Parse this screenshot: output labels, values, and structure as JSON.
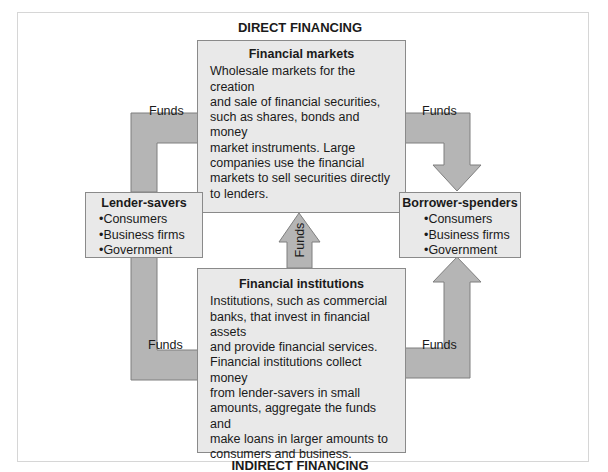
{
  "diagram": {
    "top_heading": "DIRECT FINANCING",
    "bottom_heading": "INDIRECT FINANCING",
    "financial_markets": {
      "title": "Financial markets",
      "lines": [
        "Wholesale markets for the creation",
        "and sale of financial securities,",
        "such as shares, bonds and money",
        "market instruments. Large",
        "companies use the financial",
        "markets to sell securities directly",
        "to lenders."
      ]
    },
    "financial_institutions": {
      "title": "Financial institutions",
      "lines": [
        "Institutions, such as commercial",
        "banks, that invest in financial assets",
        "and provide financial services.",
        "Financial institutions collect money",
        "from lender-savers in small",
        "amounts, aggregate the funds and",
        "make loans in larger amounts to",
        "consumers and business."
      ]
    },
    "lender_savers": {
      "title": "Lender-savers",
      "items": [
        "Consumers",
        "Business firms",
        "Government"
      ]
    },
    "borrower_spenders": {
      "title": "Borrower-spenders",
      "items": [
        "Consumers",
        "Business firms",
        "Government"
      ]
    },
    "arrows": {
      "top_left": "Funds",
      "top_right": "Funds",
      "middle": "Funds",
      "bottom_left": "Funds",
      "bottom_right": "Funds"
    },
    "colors": {
      "arrow_fill": "#b3b3b3",
      "arrow_stroke": "#7f7f7f",
      "box_fill": "#e9e9e9",
      "box_border": "#8a8a8a"
    }
  }
}
